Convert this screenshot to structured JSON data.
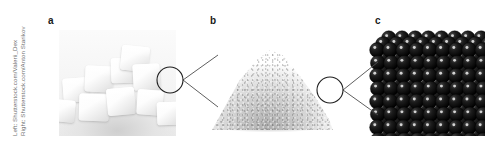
{
  "figure": {
    "background_color": "#ffffff",
    "width_px": 491,
    "height_px": 153
  },
  "credit": {
    "line_left": "Left: Shutterstock.com/Valerii_Dex",
    "line_right": "Right: Shutterstock.com/Anton Starikov",
    "color": "#6e6e6e"
  },
  "panels": [
    {
      "id": "a",
      "label": "a",
      "caption": "",
      "subject": "sugar-cubes-photograph",
      "description": "Pile of white granulated sugar cubes photographed on a light surface",
      "magnifier_circle": {
        "cx": 144,
        "cy": 74,
        "r": 13
      }
    },
    {
      "id": "b",
      "label": "b",
      "caption": "",
      "subject": "granulated-sugar-pile-photograph",
      "description": "Conical mound of fine white sugar grains",
      "magnifier_circle": {
        "cx": 304,
        "cy": 84,
        "r": 13
      }
    },
    {
      "id": "c",
      "label": "c",
      "caption": "",
      "subject": "molecular-crystal-lattice-illustration",
      "description": "Dense cubic close-packed array of dark spheres representing the crystal lattice",
      "magnifier_circle": null
    }
  ],
  "connectors": [
    {
      "from": "a-circle",
      "to": "b-panel",
      "type": "fan-lines",
      "count": 2
    },
    {
      "from": "b-circle",
      "to": "c-panel",
      "type": "fan-lines",
      "count": 2
    }
  ],
  "lattice": {
    "sphere_color": "#141414",
    "sphere_shadow_color": "#000000",
    "highlight_color": "#e8e8e8",
    "rows": 9,
    "columns": 9,
    "depth_layers": 3,
    "sphere_radius_px": 7.4
  },
  "style": {
    "letter_color": "#1a1a1a",
    "line_color": "#4d4d4d",
    "circle_stroke_color": "#1f1f1f"
  }
}
